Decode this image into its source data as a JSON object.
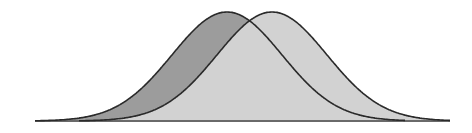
{
  "diagram": {
    "type": "overlapping-normal-distributions",
    "baseline_y": 121,
    "peak_y": 12,
    "sigma_px": 55,
    "curves": [
      {
        "name": "left-distribution",
        "mean_x": 227,
        "start_x": 35,
        "end_x": 405,
        "fill": "#9c9c9c"
      },
      {
        "name": "right-distribution",
        "mean_x": 272,
        "start_x": 79,
        "end_x": 450,
        "fill": "#d2d2d2"
      }
    ],
    "stroke": "#2a2a2a",
    "baseline_color": "#6a6a6a"
  }
}
